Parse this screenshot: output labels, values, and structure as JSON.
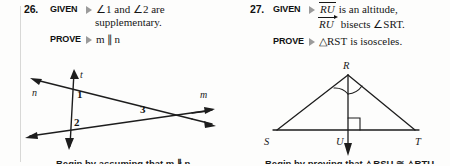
{
  "page": {
    "background_color": "#fdfdfc",
    "ink_color": "#161616",
    "marker_color": "#9b9b9b"
  },
  "exercises": [
    {
      "number": "26.",
      "given_label": "GIVEN",
      "prove_label": "PROVE",
      "given_line1": "∠1 and ∠2 are",
      "given_line2": "supplementary.",
      "prove_text_m": "m",
      "prove_text_parallel": "∥",
      "prove_text_n": "n",
      "figure": {
        "type": "two-lines-with-transversal",
        "line_labels": [
          "n",
          "m",
          "t"
        ],
        "angle_labels": [
          "1",
          "2",
          "3"
        ]
      },
      "footer_text": "Begin by assuming that m ∦ n."
    },
    {
      "number": "27.",
      "given_label": "GIVEN",
      "prove_label": "PROVE",
      "given_seg": "RU",
      "given_line1_rest": "is an altitude,",
      "given_ray": "RU",
      "given_line2_rest": "bisects ∠SRT.",
      "prove_tri_symbol": "△",
      "prove_tri_name": "RST",
      "prove_rest": "is isosceles.",
      "figure": {
        "type": "triangle-with-altitude",
        "vertex_labels": [
          "R",
          "S",
          "U",
          "T"
        ],
        "right_angle_at": "U",
        "angle_arcs_at": "R"
      },
      "footer_text": "Begin by proving that △RSU ≅ △RTU."
    }
  ]
}
